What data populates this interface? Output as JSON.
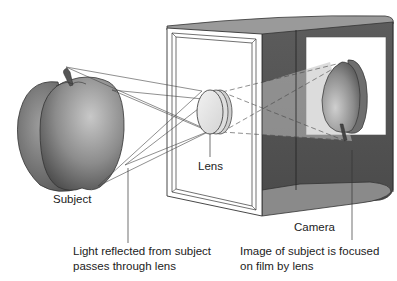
{
  "diagram": {
    "labels": {
      "subject": "Subject",
      "lens": "Lens",
      "camera": "Camera",
      "light_line1": "Light reflected from subject",
      "light_line2": "passes through lens",
      "image_line1": "Image of subject is focused",
      "image_line2": "on film by lens"
    },
    "colors": {
      "background": "#ffffff",
      "outline": "#333333",
      "camera_interior_dark": "#555555",
      "camera_floor": "#8a8a8a",
      "lens_fill": "#e6e6e6",
      "apple_dark": "#4a4a4a",
      "apple_light": "#bdbdbd",
      "film": "#ffffff",
      "text": "#222222"
    }
  }
}
